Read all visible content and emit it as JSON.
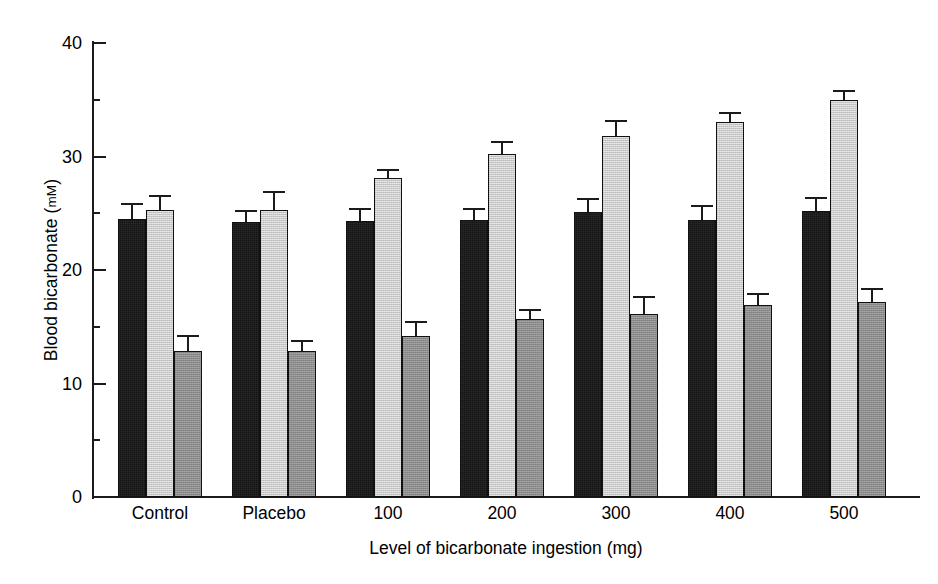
{
  "chart_data": {
    "type": "bar",
    "title": "",
    "xlabel": "Level of bicarbonate ingestion (mg)",
    "ylabel_text": "Blood bicarbonate (",
    "ylabel_units": "mM",
    "ylabel_close": ")",
    "ylabel_full": "Blood bicarbonate (mM)",
    "categories": [
      "Control",
      "Placebo",
      "100",
      "200",
      "300",
      "400",
      "500"
    ],
    "ylim": [
      0,
      40
    ],
    "yticks": [
      0,
      10,
      20,
      30,
      40
    ],
    "ytick_labels": [
      "0",
      "10",
      "20",
      "30",
      "40"
    ],
    "yminorticks": [
      5,
      15,
      25,
      35
    ],
    "grid": false,
    "legend": "none",
    "error_bars": "upper only (SEM)",
    "series": [
      {
        "name": "series-1",
        "color": "#141414",
        "values": [
          24.5,
          24.2,
          24.3,
          24.4,
          25.1,
          24.4,
          25.2
        ],
        "errors": [
          1.4,
          1.1,
          1.2,
          1.1,
          1.2,
          1.3,
          1.2
        ]
      },
      {
        "name": "series-2",
        "color": "#c9c9c9",
        "values": [
          25.3,
          25.3,
          28.1,
          30.2,
          31.8,
          33.0,
          35.0
        ],
        "errors": [
          1.3,
          1.7,
          0.8,
          1.2,
          1.4,
          0.9,
          0.9
        ]
      },
      {
        "name": "series-3",
        "color": "#8c8c8c",
        "values": [
          12.9,
          12.9,
          14.2,
          15.7,
          16.1,
          16.9,
          17.2
        ],
        "errors": [
          1.4,
          0.9,
          1.3,
          0.9,
          1.6,
          1.1,
          1.2
        ]
      }
    ]
  }
}
